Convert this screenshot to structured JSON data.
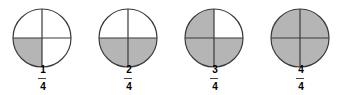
{
  "colors": {
    "shaded": "#b5b5b5",
    "unshaded": "#ffffff",
    "stroke": "#3a3a3a"
  },
  "figures": [
    {
      "numerator": "1",
      "denominator": "4",
      "label": "1/4",
      "shaded_quadrants": [
        "bottom-left"
      ]
    },
    {
      "numerator": "2",
      "denominator": "4",
      "label": "2/4",
      "shaded_quadrants": [
        "bottom-left",
        "bottom-right"
      ]
    },
    {
      "numerator": "3",
      "denominator": "4",
      "label": "3/4",
      "shaded_quadrants": [
        "top-left",
        "bottom-left",
        "bottom-right"
      ]
    },
    {
      "numerator": "4",
      "denominator": "4",
      "label": "4/4",
      "shaded_quadrants": [
        "top-left",
        "top-right",
        "bottom-left",
        "bottom-right"
      ]
    }
  ]
}
